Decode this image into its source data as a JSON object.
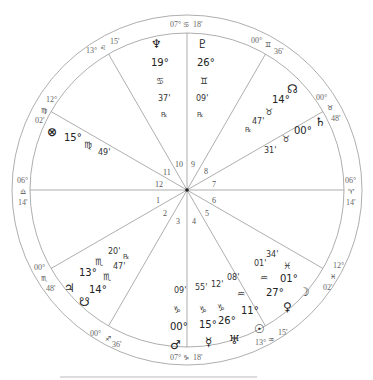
{
  "header_fragment": "chart data header (cut off)",
  "chart": {
    "center": [
      187,
      190
    ],
    "outer_radius": 175,
    "inner_radius": 157,
    "house_cusp_angles_deg": [
      180,
      210,
      240,
      270,
      300,
      330,
      0,
      30,
      60,
      90,
      120,
      150
    ],
    "house_numbers": [
      "1",
      "2",
      "3",
      "4",
      "5",
      "6",
      "7",
      "8",
      "9",
      "10",
      "11",
      "12"
    ],
    "cusps": [
      {
        "house": "1",
        "deg": "06°",
        "sign": "♎",
        "min": "14'"
      },
      {
        "house": "2",
        "deg": "00°",
        "sign": "♏",
        "min": "48'"
      },
      {
        "house": "3",
        "deg": "00°",
        "sign": "♐",
        "min": "36'"
      },
      {
        "house": "4",
        "deg": "07°",
        "sign": "♑",
        "min": "18'"
      },
      {
        "house": "5",
        "deg": "13°",
        "sign": "♒",
        "min": "15'"
      },
      {
        "house": "6",
        "deg": "12°",
        "sign": "♓",
        "min": "02'"
      },
      {
        "house": "7",
        "deg": "06°",
        "sign": "♈",
        "min": "14'"
      },
      {
        "house": "8",
        "deg": "00°",
        "sign": "♉",
        "min": "48'"
      },
      {
        "house": "9",
        "deg": "00°",
        "sign": "♊",
        "min": "36'"
      },
      {
        "house": "10",
        "deg": "07°",
        "sign": "♋",
        "min": "18'"
      },
      {
        "house": "11",
        "deg": "13°",
        "sign": "♌",
        "min": "15'"
      },
      {
        "house": "12",
        "deg": "12°",
        "sign": "♍",
        "min": "02'"
      }
    ],
    "planets": [
      {
        "name": "Neptune",
        "glyph": "♆",
        "deg": "19°",
        "sign": "♋",
        "min": "37'",
        "retro": "℞"
      },
      {
        "name": "Pluto",
        "glyph": "♇",
        "deg": "26°",
        "sign": "♊",
        "min": "09'",
        "retro": "℞"
      },
      {
        "name": "North Node",
        "glyph": "☊",
        "deg": "14°",
        "sign": "♉",
        "min": "47'",
        "retro": "℞"
      },
      {
        "name": "Saturn",
        "glyph": "♄",
        "deg": "00°",
        "sign": "♉",
        "min": "31'",
        "retro": ""
      },
      {
        "name": "Part of Fortune",
        "glyph": "⊗",
        "deg": "15°",
        "sign": "♍",
        "min": "49'",
        "retro": ""
      },
      {
        "name": "Uranus (upper)",
        "glyph": "",
        "deg": "13°",
        "sign": "♏",
        "min": "20'",
        "retro": "℞"
      },
      {
        "name": "Jupiter",
        "glyph": "♃",
        "deg": "14°",
        "sign": "♏",
        "min": "47'",
        "retro": ""
      },
      {
        "name": "South Node",
        "glyph": "☋",
        "deg": "",
        "sign": "",
        "min": "",
        "retro": ""
      },
      {
        "name": "Mars",
        "glyph": "♂",
        "deg": "00°",
        "sign": "♑",
        "min": "09'",
        "retro": ""
      },
      {
        "name": "Mercury",
        "glyph": "☿",
        "deg": "15°",
        "sign": "♑",
        "min": "55'",
        "retro": ""
      },
      {
        "name": "Uranus",
        "glyph": "♅",
        "deg": "26°",
        "sign": "♑",
        "min": "12'",
        "retro": ""
      },
      {
        "name": "Sun",
        "glyph": "☉",
        "deg": "11°",
        "sign": "♒",
        "min": "08'",
        "retro": ""
      },
      {
        "name": "Venus",
        "glyph": "♀",
        "deg": "27°",
        "sign": "♒",
        "min": "01'",
        "retro": ""
      },
      {
        "name": "Moon",
        "glyph": "☽",
        "deg": "01°",
        "sign": "♓",
        "min": "34'",
        "retro": ""
      }
    ],
    "labels": {
      "c10_deg": "07°",
      "c10_sign": "♋",
      "c10_min": "18'",
      "c4_deg": "07°",
      "c4_sign": "♑",
      "c4_min": "18'",
      "c1_deg": "06°",
      "c1_sign": "♎",
      "c1_min": "14'",
      "c7_deg": "06°",
      "c7_sign": "♈",
      "c7_min": "14'",
      "c11_deg": "13°",
      "c11_sign": "♌",
      "c11_min": "15'",
      "c9_deg": "00°",
      "c9_sign": "♊",
      "c9_min": "36'",
      "c8_deg": "00°",
      "c8_sign": "♉",
      "c8_min": "48'",
      "c12_deg": "12°",
      "c12_sign": "♍",
      "c12_min": "02'",
      "c2_deg": "00°",
      "c2_sign": "♏",
      "c2_min": "48'",
      "c3_deg": "00°",
      "c3_sign": "♐",
      "c3_min": "36'",
      "c5_deg": "13°",
      "c5_sign": "♒",
      "c5_min": "15'",
      "c6_deg": "12°",
      "c6_sign": "♓",
      "c6_min": "02'"
    }
  }
}
